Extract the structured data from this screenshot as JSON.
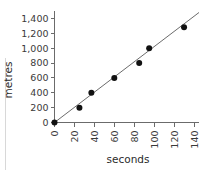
{
  "chart_data": {
    "type": "scatter",
    "title": "",
    "xlabel": "seconds",
    "ylabel": "metres",
    "xlim": [
      0,
      145
    ],
    "ylim": [
      0,
      1500
    ],
    "grid": false,
    "legend": "none",
    "x_ticks": [
      "0",
      "20",
      "40",
      "60",
      "80",
      "100",
      "120",
      "140"
    ],
    "x_tick_values": [
      0,
      20,
      40,
      60,
      80,
      100,
      120,
      140
    ],
    "y_ticks": [
      "0",
      "200",
      "400",
      "600",
      "800",
      "1,000",
      "1,200",
      "1,400"
    ],
    "y_tick_values": [
      0,
      200,
      400,
      600,
      800,
      1000,
      1200,
      1400
    ],
    "x_tick_rotation": -90,
    "points": [
      {
        "x": 0,
        "y": 0
      },
      {
        "x": 25,
        "y": 200
      },
      {
        "x": 37,
        "y": 400
      },
      {
        "x": 60,
        "y": 600
      },
      {
        "x": 85,
        "y": 800
      },
      {
        "x": 95,
        "y": 1000
      },
      {
        "x": 130,
        "y": 1280
      }
    ],
    "trend_line": {
      "type": "line-of-best-fit",
      "x_start": 0,
      "y_start": 0,
      "x_end": 145,
      "y_end": 1480
    },
    "colors": {
      "point": "#111111",
      "line": "#5a5a5a",
      "axis": "#6b6b6b",
      "text": "#2b2b2b",
      "background": "#ffffff"
    }
  }
}
